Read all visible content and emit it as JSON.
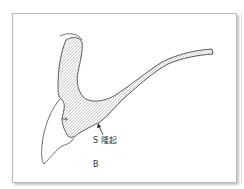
{
  "figure": {
    "labels": {
      "s_ridge": "S 隆起",
      "panel": "B"
    },
    "colors": {
      "outline": "#333333",
      "hatch": "#8a8a8a",
      "frame_border": "#b8b8b8",
      "background": "#ffffff"
    },
    "elements": [
      {
        "name": "hatched-structure",
        "type": "cross-section"
      },
      {
        "name": "outer-contour",
        "type": "outline"
      },
      {
        "name": "ridge-arrow",
        "type": "arrow",
        "points_to": "S 隆起"
      }
    ]
  }
}
